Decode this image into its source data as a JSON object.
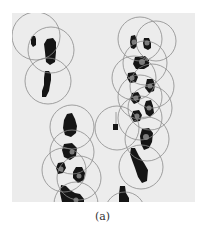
{
  "figure": {
    "caption": "(a)",
    "panel": {
      "x": 12,
      "y": 13,
      "width": 183,
      "height": 189
    },
    "colors": {
      "background": "#ececec",
      "blob": "#151515",
      "center_dot": "#7a7a7a",
      "circle_stroke": "#8a8a8a"
    },
    "circles": [
      {
        "cx": 36,
        "cy": 36,
        "r": 24
      },
      {
        "cx": 51,
        "cy": 50,
        "r": 23
      },
      {
        "cx": 48,
        "cy": 81,
        "r": 23
      },
      {
        "cx": 140,
        "cy": 39,
        "r": 22
      },
      {
        "cx": 156,
        "cy": 41,
        "r": 20
      },
      {
        "cx": 145,
        "cy": 63,
        "r": 22
      },
      {
        "cx": 134,
        "cy": 78,
        "r": 22
      },
      {
        "cx": 152,
        "cy": 86,
        "r": 22
      },
      {
        "cx": 140,
        "cy": 97,
        "r": 22
      },
      {
        "cx": 150,
        "cy": 108,
        "r": 22
      },
      {
        "cx": 140,
        "cy": 118,
        "r": 22
      },
      {
        "cx": 117,
        "cy": 128,
        "r": 22
      },
      {
        "cx": 147,
        "cy": 139,
        "r": 22
      },
      {
        "cx": 141,
        "cy": 167,
        "r": 22
      },
      {
        "cx": 72,
        "cy": 127,
        "r": 22
      },
      {
        "cx": 72,
        "cy": 152,
        "r": 22
      },
      {
        "cx": 64,
        "cy": 170,
        "r": 22
      },
      {
        "cx": 79,
        "cy": 178,
        "r": 22
      },
      {
        "cx": 76,
        "cy": 204,
        "r": 22
      },
      {
        "cx": 125,
        "cy": 212,
        "r": 20
      }
    ],
    "blobs": [
      {
        "points": "32,36 35,36 36,39 36,45 33,47 31,44 31,39"
      },
      {
        "points": "47,39 53,38 56,42 56,52 55,62 50,65 46,62 45,52 44,44"
      },
      {
        "points": "45,71 49,71 51,74 51,80 50,85 49,91 46,97 42,97 42,91 44,85 44,78"
      },
      {
        "points": "131,36 135,35 137,40 137,46 134,49 131,48 130,42"
      },
      {
        "points": "144,38 149,38 151,43 151,48 148,50 144,48 143,43"
      },
      {
        "points": "135,57 145,56 149,60 149,66 144,69 136,69 133,64"
      },
      {
        "points": "128,73 135,72 138,77 136,82 130,83 127,78"
      },
      {
        "points": "147,79 153,79 155,85 154,91 149,93 145,88"
      },
      {
        "points": "132,93 138,92 141,97 139,102 134,104 130,99"
      },
      {
        "points": "146,101 151,100 153,106 154,113 150,117 146,114 144,107"
      },
      {
        "points": "133,111 139,110 142,115 140,121 134,122 131,117"
      },
      {
        "points": "113,124 118,124 118,130 113,130"
      },
      {
        "points": "142,129 149,128 153,133 152,142 149,148 144,150 141,144 140,136"
      },
      {
        "points": "131,148 135,148 139,156 144,163 148,170 147,181 142,183 138,177 135,168 132,160 130,154"
      },
      {
        "points": "67,114 72,113 75,119 77,126 76,133 71,137 65,135 63,128 64,120"
      },
      {
        "points": "64,144 72,143 77,148 76,156 70,160 64,157 62,150"
      },
      {
        "points": "58,163 64,162 66,168 63,173 58,174 56,168"
      },
      {
        "points": "76,167 82,167 85,173 84,180 78,183 73,178 73,172"
      },
      {
        "points": "61,185 66,186 70,190 75,193 80,194 84,199 84,202 62,202 60,193"
      },
      {
        "points": "120,186 125,186 126,193 129,198 129,202 119,202 119,194"
      }
    ],
    "center_dots": [
      {
        "cx": 134,
        "cy": 42,
        "r": 2.5
      },
      {
        "cx": 147,
        "cy": 43,
        "r": 2.5
      },
      {
        "cx": 142,
        "cy": 62,
        "r": 3
      },
      {
        "cx": 132,
        "cy": 78,
        "r": 2.5
      },
      {
        "cx": 150,
        "cy": 86,
        "r": 2.5
      },
      {
        "cx": 136,
        "cy": 98,
        "r": 2.5
      },
      {
        "cx": 149,
        "cy": 108,
        "r": 2.5
      },
      {
        "cx": 137,
        "cy": 116,
        "r": 2.5
      },
      {
        "cx": 146,
        "cy": 137,
        "r": 3
      },
      {
        "cx": 72,
        "cy": 152,
        "r": 2.5
      },
      {
        "cx": 61,
        "cy": 169,
        "r": 2.5
      },
      {
        "cx": 79,
        "cy": 176,
        "r": 2.5
      },
      {
        "cx": 76,
        "cy": 200,
        "r": 2.5
      }
    ],
    "connector_lines": [
      {
        "x1": 116,
        "y1": 124,
        "x2": 116,
        "y2": 112
      }
    ]
  }
}
